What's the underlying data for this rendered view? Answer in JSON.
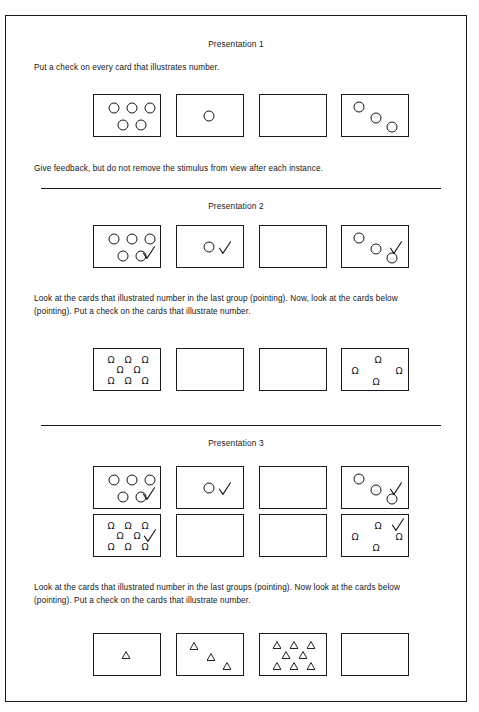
{
  "document": {
    "kind": "instructional-worksheet",
    "border_color": "#1a1a1a",
    "background": "#ffffff",
    "ink_color": "#151515"
  },
  "sections": [
    {
      "id": "presentation-1",
      "title": "Presentation 1",
      "instruction_above": "Put a check on every card that illustrates number.",
      "instruction_below": "Give feedback, but do not remove the stimulus from view after each instance.",
      "card_rows": [
        {
          "id": "p1-circle-row",
          "cards": [
            {
              "id": "p1-card-1",
              "shape": "circle",
              "count": 5,
              "checked": false,
              "layout": "grid-3-2"
            },
            {
              "id": "p1-card-2",
              "shape": "circle",
              "count": 1,
              "checked": false,
              "layout": "single-center"
            },
            {
              "id": "p1-card-3",
              "shape": "none",
              "count": 0,
              "checked": false,
              "layout": "empty"
            },
            {
              "id": "p1-card-4",
              "shape": "circle",
              "count": 3,
              "checked": false,
              "layout": "diagonal"
            }
          ]
        }
      ]
    },
    {
      "id": "presentation-2",
      "title": "Presentation 2",
      "instruction_above": "",
      "instruction_below": "Look at the cards that illustrated number in the last group (pointing).  Now, look at the cards below (pointing).  Put a check on the cards that illustrate number.",
      "card_rows": [
        {
          "id": "p2-circle-row",
          "cards": [
            {
              "id": "p2-card-1",
              "shape": "circle",
              "count": 5,
              "checked": true,
              "layout": "grid-3-2"
            },
            {
              "id": "p2-card-2",
              "shape": "circle",
              "count": 1,
              "checked": true,
              "layout": "single-center"
            },
            {
              "id": "p2-card-3",
              "shape": "none",
              "count": 0,
              "checked": false,
              "layout": "empty"
            },
            {
              "id": "p2-card-4",
              "shape": "circle",
              "count": 3,
              "checked": true,
              "layout": "diagonal"
            }
          ]
        },
        {
          "id": "p2-omega-row",
          "cards": [
            {
              "id": "p2-omega-1",
              "shape": "omega",
              "count": 8,
              "checked": false,
              "layout": "grid-3-2-3"
            },
            {
              "id": "p2-omega-2",
              "shape": "none",
              "count": 0,
              "checked": false,
              "layout": "empty"
            },
            {
              "id": "p2-omega-3",
              "shape": "none",
              "count": 0,
              "checked": false,
              "layout": "empty"
            },
            {
              "id": "p2-omega-4",
              "shape": "omega",
              "count": 4,
              "checked": false,
              "layout": "diamond"
            }
          ]
        }
      ]
    },
    {
      "id": "presentation-3",
      "title": "Presentation 3",
      "instruction_above": "",
      "instruction_below": "Look at the cards that illustrated number in the last groups (pointing).  Now look at the cards below (pointing).  Put a check on the cards that illustrate number.",
      "card_rows": [
        {
          "id": "p3-circle-row",
          "cards": [
            {
              "id": "p3-card-1",
              "shape": "circle",
              "count": 5,
              "checked": true,
              "layout": "grid-3-2"
            },
            {
              "id": "p3-card-2",
              "shape": "circle",
              "count": 1,
              "checked": true,
              "layout": "single-center"
            },
            {
              "id": "p3-card-3",
              "shape": "none",
              "count": 0,
              "checked": false,
              "layout": "empty"
            },
            {
              "id": "p3-card-4",
              "shape": "circle",
              "count": 3,
              "checked": true,
              "layout": "diagonal"
            }
          ]
        },
        {
          "id": "p3-omega-row",
          "cards": [
            {
              "id": "p3-omega-1",
              "shape": "omega",
              "count": 8,
              "checked": true,
              "layout": "grid-3-2-3"
            },
            {
              "id": "p3-omega-2",
              "shape": "none",
              "count": 0,
              "checked": false,
              "layout": "empty"
            },
            {
              "id": "p3-omega-3",
              "shape": "none",
              "count": 0,
              "checked": false,
              "layout": "empty"
            },
            {
              "id": "p3-omega-4",
              "shape": "omega",
              "count": 4,
              "checked": true,
              "layout": "diamond"
            }
          ]
        },
        {
          "id": "p3-triangle-row",
          "cards": [
            {
              "id": "p3-tri-1",
              "shape": "triangle",
              "count": 1,
              "checked": false,
              "layout": "single-center"
            },
            {
              "id": "p3-tri-2",
              "shape": "triangle",
              "count": 3,
              "checked": false,
              "layout": "diagonal"
            },
            {
              "id": "p3-tri-3",
              "shape": "triangle",
              "count": 8,
              "checked": false,
              "layout": "grid-3-2-3"
            },
            {
              "id": "p3-tri-4",
              "shape": "none",
              "count": 0,
              "checked": false,
              "layout": "empty"
            }
          ]
        }
      ]
    }
  ],
  "glyph_layouts": {
    "grid-3-2": [
      [
        20,
        13
      ],
      [
        38,
        13
      ],
      [
        56,
        13
      ],
      [
        29,
        30
      ],
      [
        47,
        30
      ]
    ],
    "single-center": [
      [
        32,
        21
      ]
    ],
    "diagonal": [
      [
        17,
        12
      ],
      [
        34,
        23
      ],
      [
        50,
        32
      ]
    ],
    "grid-3-2-3": [
      [
        17,
        11
      ],
      [
        34,
        11
      ],
      [
        51,
        11
      ],
      [
        26,
        21
      ],
      [
        43,
        21
      ],
      [
        17,
        32
      ],
      [
        34,
        32
      ],
      [
        51,
        32
      ]
    ],
    "diamond": [
      [
        36,
        11
      ],
      [
        13,
        22
      ],
      [
        57,
        22
      ],
      [
        34,
        33
      ]
    ]
  },
  "check_positions": {
    "grid-3-2": [
      55,
      27
    ],
    "single-center": [
      48,
      22
    ],
    "diagonal": [
      54,
      22
    ],
    "grid-3-2-3": [
      56,
      21
    ],
    "diamond": [
      56,
      10
    ]
  },
  "geometry": {
    "card_width": 68,
    "card_height": 43,
    "card_left_positions": [
      92,
      175,
      258,
      340
    ],
    "circle_diameter": 11,
    "triangle_size": 9,
    "rows": [
      {
        "row_id": "p1-circle-row",
        "top": 93
      },
      {
        "row_id": "p2-circle-row",
        "top": 224
      },
      {
        "row_id": "p2-omega-row",
        "top": 347
      },
      {
        "row_id": "p3-circle-row",
        "top": 465
      },
      {
        "row_id": "p3-omega-row",
        "top": 513
      },
      {
        "row_id": "p3-triangle-row",
        "top": 632
      }
    ]
  },
  "text_blocks": [
    {
      "id": "p1-title",
      "text_path": "sections.0.title",
      "top": 38,
      "kind": "title"
    },
    {
      "id": "p1-above",
      "text_path": "sections.0.instruction_above",
      "top": 60,
      "kind": "body"
    },
    {
      "id": "p1-below",
      "text_path": "sections.0.instruction_below",
      "top": 161,
      "kind": "body"
    },
    {
      "id": "p2-title",
      "text_path": "sections.1.title",
      "top": 200,
      "kind": "title"
    },
    {
      "id": "p2-below",
      "text_path": "sections.1.instruction_below",
      "top": 291,
      "kind": "body"
    },
    {
      "id": "p3-title",
      "text_path": "sections.2.title",
      "top": 437,
      "kind": "title"
    },
    {
      "id": "p3-below",
      "text_path": "sections.2.instruction_below",
      "top": 580,
      "kind": "body"
    }
  ],
  "dividers": [
    {
      "id": "divider-1",
      "top": 187,
      "left": 40,
      "width": 400
    },
    {
      "id": "divider-2",
      "top": 424,
      "left": 40,
      "width": 400
    }
  ]
}
